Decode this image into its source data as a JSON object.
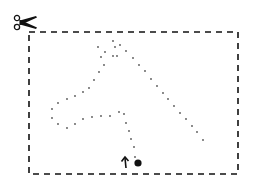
{
  "colors": {
    "background": "#ffffff",
    "ink": "#111111",
    "dots": "#555555"
  },
  "frame": {
    "x": 29,
    "y": 32,
    "width": 209,
    "height": 142,
    "dash": "6,5",
    "stroke_width": 1.6
  },
  "scissors": {
    "icon": "scissors-icon",
    "x": 14,
    "y": 16,
    "width": 20,
    "height": 13
  },
  "start_marker": {
    "icon": "arrow-up-icon",
    "x": 126,
    "y": 158
  },
  "start_dot": {
    "icon": "filled-dot-icon",
    "cx": 138,
    "cy": 163,
    "r": 3.6
  },
  "dotted_path": {
    "dot_radius": 0.9,
    "points": [
      [
        135,
        157
      ],
      [
        134,
        147
      ],
      [
        131,
        139
      ],
      [
        129,
        131
      ],
      [
        126,
        123
      ],
      [
        124,
        114
      ],
      [
        119,
        112
      ],
      [
        110,
        116
      ],
      [
        101,
        116
      ],
      [
        92,
        117
      ],
      [
        83,
        119
      ],
      [
        75,
        124
      ],
      [
        67,
        128
      ],
      [
        58,
        124
      ],
      [
        52,
        118
      ],
      [
        52,
        109
      ],
      [
        58,
        103
      ],
      [
        67,
        99
      ],
      [
        75,
        96
      ],
      [
        83,
        92
      ],
      [
        89,
        88
      ],
      [
        94,
        80
      ],
      [
        99,
        72
      ],
      [
        104,
        65
      ],
      [
        101,
        57
      ],
      [
        98,
        47
      ],
      [
        113,
        41
      ],
      [
        115,
        47
      ],
      [
        120,
        45
      ],
      [
        126,
        51
      ],
      [
        133,
        58
      ],
      [
        105,
        52
      ],
      [
        113,
        56
      ],
      [
        117,
        56
      ],
      [
        139,
        65
      ],
      [
        145,
        71
      ],
      [
        151,
        79
      ],
      [
        157,
        86
      ],
      [
        163,
        93
      ],
      [
        168,
        99
      ],
      [
        174,
        106
      ],
      [
        180,
        113
      ],
      [
        186,
        119
      ],
      [
        192,
        126
      ],
      [
        197,
        132
      ],
      [
        203,
        140
      ]
    ]
  }
}
